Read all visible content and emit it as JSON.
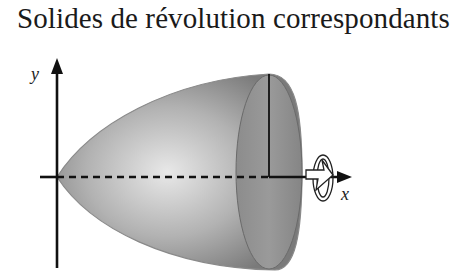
{
  "title": "Solides de révolution correspondants",
  "diagram": {
    "y_axis_label": "y",
    "x_axis_label": "x",
    "solid": "paraboloid-of-revolution",
    "rotation_axis": "x",
    "icons": [
      "rotation-arrow-icon"
    ],
    "colors": {
      "solid_dark": "#6e6e6e",
      "solid_light": "#e4e4e4",
      "cap": "#8a8a8a",
      "axis": "#111111"
    }
  }
}
